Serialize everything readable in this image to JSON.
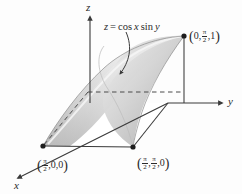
{
  "figure": {
    "kind": "3d-surface-diagram",
    "width": 242,
    "height": 194,
    "background_color": "#fdfdfd",
    "line_color": "#3a3a3a",
    "surface_light_color": "#f2f2f2",
    "surface_mid_color": "#c9c9c9",
    "surface_dark_color": "#9a9a9a"
  },
  "axes": {
    "x_label": "x",
    "y_label": "y",
    "z_label": "z",
    "origin_px": [
      168,
      103
    ]
  },
  "equation": {
    "label_full": "z = cos x sin y",
    "lhs": "z",
    "equals": "=",
    "rhs_cos": "cos",
    "rhs_x": "x",
    "rhs_sin": "sin",
    "rhs_y": "y"
  },
  "points": [
    {
      "name": "point-top-right",
      "label_full": "(0, π/2, 1)",
      "open_paren": "(",
      "coord1": "0,",
      "coord2_num": "π",
      "coord2_den": "2",
      "coord2_sep": ",",
      "coord3": "1",
      "close_paren": ")",
      "marker_px": [
        184,
        36
      ]
    },
    {
      "name": "point-x-axis",
      "label_full": "(π/2, 0, 0)",
      "open_paren": "(",
      "coord1_num": "π",
      "coord1_den": "2",
      "coord1_sep": ",",
      "coord2": "0,",
      "coord3": "0",
      "close_paren": ")",
      "marker_px": [
        43,
        146
      ]
    },
    {
      "name": "point-corner",
      "label_full": "(π/2, π/2, 0)",
      "open_paren": "(",
      "coord1_num": "π",
      "coord1_den": "2",
      "coord1_sep": ",",
      "coord2_num": "π",
      "coord2_den": "2",
      "coord2_sep": ",",
      "coord3": "0",
      "close_paren": ")",
      "marker_px": [
        133,
        147
      ]
    }
  ],
  "annotations": {
    "leader_arrow": "curved-arrow-pointing-to-surface",
    "dashed_horizontal": "dashed-line-from-surface-to-y-axis",
    "dashed_diagonal": "dashed-line-toward-x-axis-origin"
  }
}
